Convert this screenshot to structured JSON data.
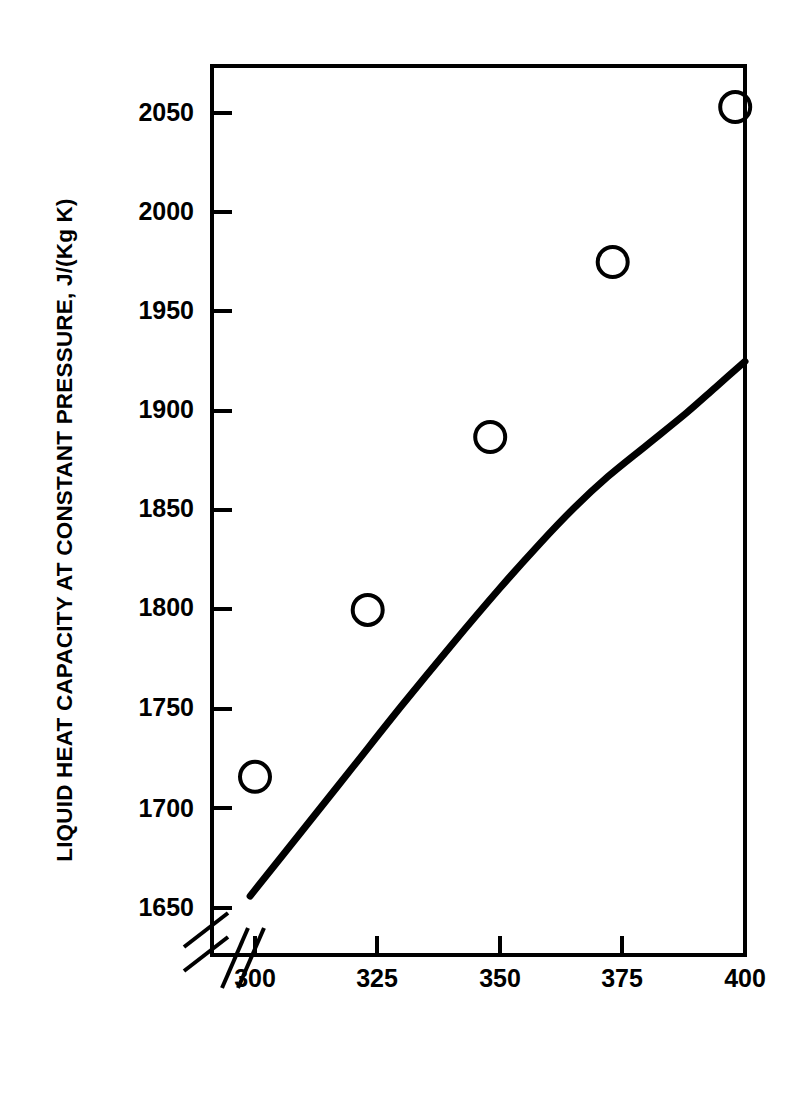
{
  "chart_data": {
    "type": "scatter",
    "title": "",
    "subtitle": "",
    "xlabel": "TEMPERATURE, K",
    "ylabel": "LIQUID HEAT CAPACITY AT CONSTANT PRESSURE, J/(Kg K)",
    "xlim": [
      295,
      400
    ],
    "ylim": [
      1635,
      2085
    ],
    "xticks": [
      300,
      325,
      350,
      375,
      400
    ],
    "xtick_labels": [
      "300",
      "325",
      "350",
      "375",
      "400"
    ],
    "yticks": [
      1650,
      1700,
      1750,
      1800,
      1850,
      1900,
      1950,
      2000,
      2050
    ],
    "ytick_labels": [
      "1650",
      "1700",
      "1750",
      "1800",
      "1850",
      "1900",
      "1950",
      "2000",
      "2050"
    ],
    "grid": false,
    "legend": null,
    "axis_break": {
      "x_break": true,
      "y_break": true,
      "note": "double-slash break marks near origin on both axes"
    },
    "series": [
      {
        "name": "experimental data",
        "type": "scatter",
        "marker": "open-circle",
        "color": "#000000",
        "points": [
          {
            "x": 300,
            "y": 1716
          },
          {
            "x": 323,
            "y": 1800
          },
          {
            "x": 348,
            "y": 1887
          },
          {
            "x": 373,
            "y": 1975
          },
          {
            "x": 398,
            "y": 2053
          }
        ]
      },
      {
        "name": "correlation curve",
        "type": "line",
        "color": "#000000",
        "linewidth": 5,
        "points": [
          {
            "x": 299,
            "y": 1656
          },
          {
            "x": 310,
            "y": 1690
          },
          {
            "x": 320,
            "y": 1721
          },
          {
            "x": 330,
            "y": 1752
          },
          {
            "x": 340,
            "y": 1782
          },
          {
            "x": 350,
            "y": 1811
          },
          {
            "x": 358,
            "y": 1833
          },
          {
            "x": 365,
            "y": 1851
          },
          {
            "x": 372,
            "y": 1867
          },
          {
            "x": 380,
            "y": 1883
          },
          {
            "x": 388,
            "y": 1899
          },
          {
            "x": 394,
            "y": 1912
          },
          {
            "x": 400,
            "y": 1925
          }
        ]
      }
    ]
  },
  "axes": {
    "ylabel": "LIQUID HEAT CAPACITY AT CONSTANT PRESSURE, J/(Kg K)",
    "xlabel": "TEMPERATURE, K",
    "ytick_labels": [
      "2050",
      "2000",
      "1950",
      "1900",
      "1850",
      "1800",
      "1750",
      "1700",
      "1650"
    ],
    "xtick_labels": [
      "300",
      "325",
      "350",
      "375",
      "400"
    ]
  },
  "colors": {
    "background": "#ffffff",
    "foreground": "#000000"
  }
}
